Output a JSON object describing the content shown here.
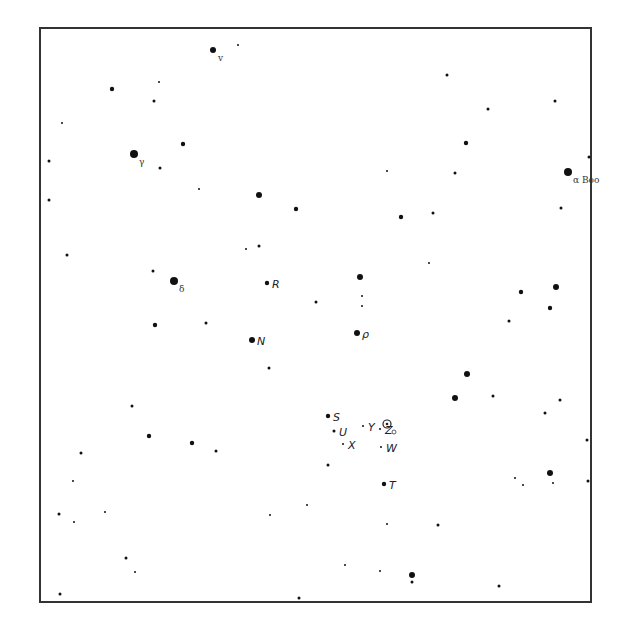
{
  "chart_data": {
    "type": "scatter",
    "title": "",
    "frame_color": "#333333",
    "star_color": "#111111",
    "stars": [
      {
        "x": 213,
        "y": 50,
        "mag": 2,
        "label": "v",
        "kind": "greek"
      },
      {
        "x": 238,
        "y": 45,
        "mag": 5
      },
      {
        "x": 159,
        "y": 82,
        "mag": 5
      },
      {
        "x": 154,
        "y": 101,
        "mag": 4
      },
      {
        "x": 112,
        "y": 89,
        "mag": 3
      },
      {
        "x": 62,
        "y": 123,
        "mag": 5
      },
      {
        "x": 134,
        "y": 154,
        "mag": 1,
        "label": "γ",
        "kind": "greek"
      },
      {
        "x": 183,
        "y": 144,
        "mag": 3
      },
      {
        "x": 160,
        "y": 168,
        "mag": 4
      },
      {
        "x": 199,
        "y": 189,
        "mag": 5
      },
      {
        "x": 259,
        "y": 195,
        "mag": 2
      },
      {
        "x": 296,
        "y": 209,
        "mag": 3
      },
      {
        "x": 49,
        "y": 161,
        "mag": 4
      },
      {
        "x": 49,
        "y": 200,
        "mag": 4
      },
      {
        "x": 67,
        "y": 255,
        "mag": 4
      },
      {
        "x": 153,
        "y": 271,
        "mag": 4
      },
      {
        "x": 174,
        "y": 281,
        "mag": 1,
        "label": "δ",
        "kind": "greek"
      },
      {
        "x": 267,
        "y": 283,
        "mag": 3,
        "label": "R",
        "kind": "variable"
      },
      {
        "x": 259,
        "y": 246,
        "mag": 4
      },
      {
        "x": 246,
        "y": 249,
        "mag": 5
      },
      {
        "x": 316,
        "y": 302,
        "mag": 4
      },
      {
        "x": 447,
        "y": 75,
        "mag": 4
      },
      {
        "x": 488,
        "y": 109,
        "mag": 4
      },
      {
        "x": 466,
        "y": 143,
        "mag": 3
      },
      {
        "x": 455,
        "y": 173,
        "mag": 4
      },
      {
        "x": 433,
        "y": 213,
        "mag": 4
      },
      {
        "x": 401,
        "y": 217,
        "mag": 3
      },
      {
        "x": 387,
        "y": 171,
        "mag": 5
      },
      {
        "x": 555,
        "y": 101,
        "mag": 4
      },
      {
        "x": 589,
        "y": 157,
        "mag": 4
      },
      {
        "x": 568,
        "y": 172,
        "mag": 1,
        "label": "α Boo",
        "kind": "greek"
      },
      {
        "x": 561,
        "y": 208,
        "mag": 4
      },
      {
        "x": 360,
        "y": 277,
        "mag": 2
      },
      {
        "x": 362,
        "y": 296,
        "mag": 5
      },
      {
        "x": 362,
        "y": 306,
        "mag": 5
      },
      {
        "x": 429,
        "y": 263,
        "mag": 5
      },
      {
        "x": 521,
        "y": 292,
        "mag": 3
      },
      {
        "x": 556,
        "y": 287,
        "mag": 2
      },
      {
        "x": 550,
        "y": 308,
        "mag": 3
      },
      {
        "x": 509,
        "y": 321,
        "mag": 4
      },
      {
        "x": 155,
        "y": 325,
        "mag": 3
      },
      {
        "x": 206,
        "y": 323,
        "mag": 4
      },
      {
        "x": 252,
        "y": 340,
        "mag": 2,
        "label": "N",
        "kind": "variable"
      },
      {
        "x": 269,
        "y": 368,
        "mag": 4
      },
      {
        "x": 132,
        "y": 406,
        "mag": 4
      },
      {
        "x": 149,
        "y": 436,
        "mag": 3
      },
      {
        "x": 192,
        "y": 443,
        "mag": 3
      },
      {
        "x": 216,
        "y": 451,
        "mag": 4
      },
      {
        "x": 81,
        "y": 453,
        "mag": 4
      },
      {
        "x": 73,
        "y": 481,
        "mag": 5
      },
      {
        "x": 59,
        "y": 514,
        "mag": 4
      },
      {
        "x": 74,
        "y": 522,
        "mag": 5
      },
      {
        "x": 105,
        "y": 512,
        "mag": 5
      },
      {
        "x": 126,
        "y": 558,
        "mag": 4
      },
      {
        "x": 60,
        "y": 594,
        "mag": 4
      },
      {
        "x": 299,
        "y": 598,
        "mag": 4
      },
      {
        "x": 135,
        "y": 572,
        "mag": 5
      },
      {
        "x": 270,
        "y": 515,
        "mag": 5
      },
      {
        "x": 357,
        "y": 333,
        "mag": 2,
        "label": "ρ",
        "kind": "variable"
      },
      {
        "x": 467,
        "y": 374,
        "mag": 2
      },
      {
        "x": 455,
        "y": 398,
        "mag": 2
      },
      {
        "x": 493,
        "y": 396,
        "mag": 4
      },
      {
        "x": 560,
        "y": 400,
        "mag": 4
      },
      {
        "x": 545,
        "y": 413,
        "mag": 4
      },
      {
        "x": 328,
        "y": 416,
        "mag": 3,
        "label": "S",
        "kind": "variable"
      },
      {
        "x": 334,
        "y": 431,
        "mag": 4,
        "label": "U",
        "kind": "variable"
      },
      {
        "x": 363,
        "y": 426,
        "mag": 5,
        "label": "Y",
        "kind": "variable"
      },
      {
        "x": 380,
        "y": 429,
        "mag": 5,
        "label": "Z",
        "kind": "variable"
      },
      {
        "x": 343,
        "y": 444,
        "mag": 5,
        "label": "X",
        "kind": "variable"
      },
      {
        "x": 381,
        "y": 447,
        "mag": 5,
        "label": "W",
        "kind": "variable"
      },
      {
        "x": 384,
        "y": 484,
        "mag": 3,
        "label": "T",
        "kind": "variable"
      },
      {
        "x": 328,
        "y": 465,
        "mag": 4
      },
      {
        "x": 387,
        "y": 524,
        "mag": 5
      },
      {
        "x": 438,
        "y": 525,
        "mag": 4
      },
      {
        "x": 550,
        "y": 473,
        "mag": 2
      },
      {
        "x": 515,
        "y": 478,
        "mag": 5
      },
      {
        "x": 523,
        "y": 485,
        "mag": 5
      },
      {
        "x": 553,
        "y": 483,
        "mag": 5
      },
      {
        "x": 587,
        "y": 440,
        "mag": 4
      },
      {
        "x": 588,
        "y": 481,
        "mag": 4
      },
      {
        "x": 412,
        "y": 575,
        "mag": 2
      },
      {
        "x": 412,
        "y": 582,
        "mag": 4
      },
      {
        "x": 499,
        "y": 586,
        "mag": 4
      },
      {
        "x": 345,
        "y": 565,
        "mag": 5
      },
      {
        "x": 380,
        "y": 571,
        "mag": 5
      },
      {
        "x": 307,
        "y": 505,
        "mag": 5
      }
    ],
    "markers": [
      {
        "name": "target-circle",
        "x": 387,
        "y": 424,
        "label": "O"
      }
    ]
  }
}
